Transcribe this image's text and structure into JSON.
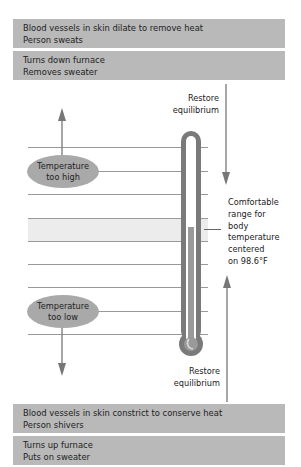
{
  "top_boxes": [
    {
      "line1": "Blood vessels in skin dilate to remove heat",
      "line2": "Person sweats"
    },
    {
      "line1": "Turns down furnace",
      "line2": "Removes sweater"
    }
  ],
  "bottom_boxes": [
    {
      "line1": "Blood vessels in skin constrict to conserve heat",
      "line2": "Person shivers"
    },
    {
      "line1": "Turns up furnace",
      "line2": "Puts on sweater"
    }
  ],
  "restore_top": {
    "line1": "Restore",
    "line2": "equilibrium"
  },
  "restore_bottom": {
    "line1": "Restore",
    "line2": "equilibrium"
  },
  "ellipse_high": {
    "line1": "Temperature",
    "line2": "too high"
  },
  "ellipse_low": {
    "line1": "Temperature",
    "line2": "too low"
  },
  "comfort_label": [
    "Comfortable",
    "range for",
    "body",
    "temperature",
    "centered",
    "on 98.6°F"
  ],
  "colors": {
    "box": "#b9b9b9",
    "ellipse": "#a9a9a9",
    "thermometer": "#7a7a7a",
    "band": "#ececec",
    "line": "#999999"
  }
}
